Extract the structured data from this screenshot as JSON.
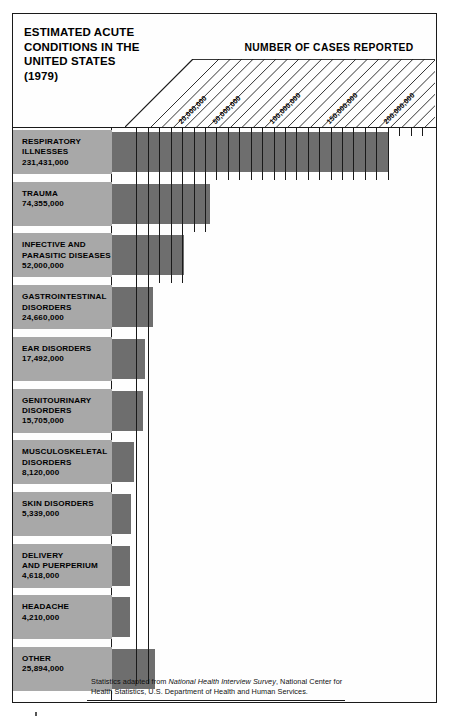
{
  "title": {
    "lines": [
      "ESTIMATED ACUTE",
      "CONDITIONS IN THE",
      "UNITED STATES",
      "(1979)"
    ]
  },
  "axis_heading": "NUMBER OF CASES REPORTED",
  "footnote": {
    "prefix": "Statistics adapted from ",
    "italic": "National Health Interview Survey",
    "suffix": ", National Center for Health Statistics, U.S. Department of Health and Human Services."
  },
  "colors": {
    "bar": "#6e6e6e",
    "label_panel": "#a8a8a8",
    "ink": "#1a1a1a",
    "paper": "#ffffff"
  },
  "chart_data": {
    "type": "bar",
    "orientation": "horizontal",
    "title": "ESTIMATED ACUTE CONDITIONS IN THE UNITED STATES (1979)",
    "xlabel": "NUMBER OF CASES REPORTED",
    "ylabel": "",
    "xlim": [
      0,
      260000000
    ],
    "grid": true,
    "grid_step": 10000000,
    "legend": "none",
    "tick_labels": [
      "20,000,000",
      "50,000,000",
      "100,000,000",
      "150,000,000",
      "200,000,000",
      "250,000,000"
    ],
    "tick_values": [
      20000000,
      50000000,
      100000000,
      150000000,
      200000000,
      250000000
    ],
    "categories": [
      "RESPIRATORY ILLNESSES",
      "TRAUMA",
      "INFECTIVE AND PARASITIC DISEASES",
      "GASTROINTESTINAL DISORDERS",
      "EAR DISORDERS",
      "GENITOURINARY DISORDERS",
      "MUSCULOSKELETAL DISORDERS",
      "SKIN DISORDERS",
      "DELIVERY AND PUERPERIUM",
      "HEADACHE",
      "OTHER"
    ],
    "values": [
      231431000,
      74355000,
      52000000,
      24660000,
      17492000,
      15705000,
      8120000,
      5339000,
      4618000,
      4210000,
      25894000
    ],
    "value_labels": [
      "231,431,000",
      "74,355,000",
      "52,000,000",
      "24,660,000",
      "17,492,000",
      "15,705,000",
      "8,120,000",
      "5,339,000",
      "4,618,000",
      "4,210,000",
      "25,894,000"
    ]
  },
  "rows": [
    {
      "name_lines": [
        "RESPIRATORY",
        "ILLNESSES"
      ],
      "value": "231,431,000"
    },
    {
      "name_lines": [
        "TRAUMA"
      ],
      "value": "74,355,000"
    },
    {
      "name_lines": [
        "INFECTIVE AND",
        "PARASITIC DISEASES"
      ],
      "value": "52,000,000"
    },
    {
      "name_lines": [
        "GASTROINTESTINAL",
        "DISORDERS"
      ],
      "value": "24,660,000"
    },
    {
      "name_lines": [
        "EAR DISORDERS"
      ],
      "value": "17,492,000"
    },
    {
      "name_lines": [
        "GENITOURINARY",
        "DISORDERS"
      ],
      "value": "15,705,000"
    },
    {
      "name_lines": [
        "MUSCULOSKELETAL",
        "DISORDERS"
      ],
      "value": "8,120,000"
    },
    {
      "name_lines": [
        "SKIN DISORDERS"
      ],
      "value": "5,339,000"
    },
    {
      "name_lines": [
        "DELIVERY",
        "AND PUERPERIUM"
      ],
      "value": "4,618,000"
    },
    {
      "name_lines": [
        "HEADACHE"
      ],
      "value": "4,210,000"
    },
    {
      "name_lines": [
        "OTHER"
      ],
      "value": "25,894,000"
    }
  ]
}
